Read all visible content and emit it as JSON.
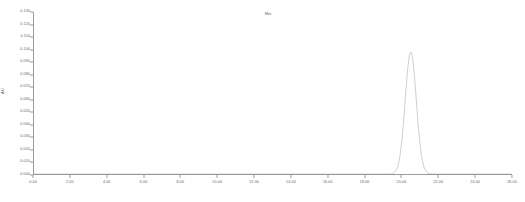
{
  "chart_data": {
    "type": "line",
    "title": "",
    "subtitle": "",
    "xlabel": "Min",
    "ylabel": "AU",
    "xlim": [
      0.0,
      26.0
    ],
    "ylim": [
      0.0,
      0.13
    ],
    "grid": false,
    "legend": null,
    "x_ticks": [
      0.0,
      2.0,
      4.0,
      6.0,
      8.0,
      10.0,
      12.0,
      14.0,
      16.0,
      18.0,
      20.0,
      22.0,
      24.0,
      26.0
    ],
    "x_tick_labels": [
      "0.00",
      "2.00",
      "4.00",
      "6.00",
      "8.00",
      "10.00",
      "12.00",
      "14.00",
      "16.00",
      "18.00",
      "20.00",
      "22.00",
      "24.00",
      "26.00"
    ],
    "y_ticks": [
      0.13,
      0.12,
      0.11,
      0.1,
      0.09,
      0.08,
      0.07,
      0.06,
      0.05,
      0.04,
      0.03,
      0.02,
      0.01,
      0.0
    ],
    "y_tick_labels": [
      "0.130",
      "0.120",
      "0.110",
      "0.100",
      "0.090",
      "0.080",
      "0.070",
      "0.060",
      "0.050",
      "0.040",
      "0.030",
      "0.020",
      "0.010",
      "0.000"
    ],
    "series": [
      {
        "name": "detector-trace",
        "color": "#b9b9b9",
        "baseline": 0.0008,
        "peaks": [
          {
            "retention_time": 20.45,
            "height": 0.0975,
            "width_sigma": 0.3
          }
        ],
        "x": [
          0.0,
          1.0,
          2.0,
          3.0,
          4.0,
          5.0,
          6.0,
          7.0,
          8.0,
          9.0,
          10.0,
          11.0,
          12.0,
          13.0,
          14.0,
          15.0,
          16.0,
          17.0,
          18.0,
          19.0,
          19.4,
          19.6,
          19.8,
          20.0,
          20.15,
          20.3,
          20.45,
          20.6,
          20.75,
          20.9,
          21.1,
          21.3,
          21.6,
          22.0,
          23.0,
          24.0,
          25.0,
          26.0
        ],
        "y": [
          0.0008,
          0.0008,
          0.0008,
          0.0008,
          0.0008,
          0.0008,
          0.0008,
          0.0008,
          0.0008,
          0.0008,
          0.0008,
          0.0008,
          0.0008,
          0.0008,
          0.0008,
          0.0008,
          0.0008,
          0.0008,
          0.0008,
          0.0011,
          0.0025,
          0.006,
          0.018,
          0.046,
          0.076,
          0.094,
          0.0975,
          0.093,
          0.074,
          0.044,
          0.017,
          0.0055,
          0.0016,
          0.0009,
          0.0008,
          0.0008,
          0.0008,
          0.0008
        ]
      }
    ]
  },
  "axes": {
    "y_title": "AU",
    "x_title": "Min"
  }
}
